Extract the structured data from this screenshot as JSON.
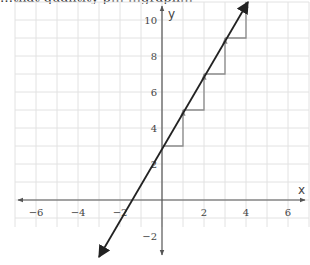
{
  "header": {
    "cut_off_text": "…that quantity p… …graph…"
  },
  "chart_data": {
    "type": "line",
    "title": "",
    "xlabel": "x",
    "ylabel": "y",
    "xlim": [
      -7,
      7
    ],
    "ylim": [
      -3,
      11
    ],
    "grid": true,
    "x_ticks": [
      -6,
      -4,
      -2,
      2,
      4,
      6
    ],
    "y_ticks": [
      -2,
      2,
      4,
      6,
      8,
      10
    ],
    "x_tick_labels": [
      "−6",
      "−4",
      "−2",
      "2",
      "4",
      "6"
    ],
    "y_tick_labels": [
      "−2",
      "2",
      "4",
      "6",
      "8",
      "10"
    ],
    "series": [
      {
        "name": "line",
        "equation": "y = 2x + 3",
        "slope": 2,
        "intercept": 3,
        "x": [
          -3,
          4
        ],
        "y": [
          -3,
          11
        ],
        "color": "#222222",
        "arrows_both_ends": true
      }
    ],
    "annotations": {
      "slope_steps": [
        {
          "from": [
            0,
            3
          ],
          "run": 1,
          "rise": 2
        },
        {
          "from": [
            1,
            5
          ],
          "run": 1,
          "rise": 2
        },
        {
          "from": [
            2,
            7
          ],
          "run": 1,
          "rise": 2
        },
        {
          "from": [
            3,
            9
          ],
          "run": 1,
          "rise": 2
        }
      ],
      "step_color": "#888888"
    }
  },
  "colors": {
    "grid": "#e2e2e2",
    "axis": "#555555",
    "line": "#222222",
    "steps": "#8a8a8a"
  }
}
